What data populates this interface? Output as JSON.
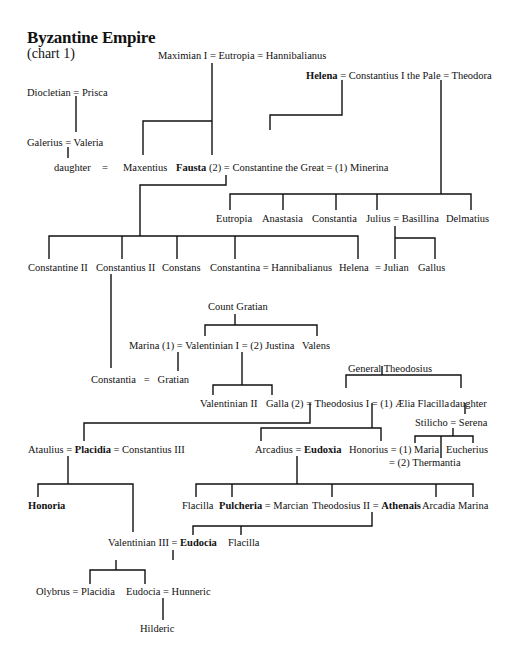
{
  "title": "Byzantine Empire",
  "subtitle": "(chart 1)",
  "nodes": {
    "maximian": "Maximian I = Eutropia = Hannibalianus",
    "diocletian": "Diocletian = Prisca",
    "galerius": "Galerius = Valeria",
    "helena_row": {
      "bold": "Helena",
      "rest": " = Constantius I the Pale = Theodora"
    },
    "daughter": "daughter",
    "eq1": "=",
    "maxentius": "Maxentius",
    "fausta_row": {
      "bold": "Fausta",
      "rest": " (2) = Constantine the Great = (1) Minerina"
    },
    "eutropia": "Eutropia",
    "anastasia": "Anastasia",
    "constantia1": "Constantia",
    "julius": "Julius = Basillina",
    "delmatius": "Delmatius",
    "constantine2": "Constantine II",
    "constantius2": "Constantius II",
    "constans": "Constans",
    "constantina": "Constantina = Hannibalianus",
    "helena2": "Helena",
    "julian": "= Julian",
    "gallus": "Gallus",
    "count_gratian": "Count Gratian",
    "valentinian1": "Marina (1) = Valentinian I = (2) Justina",
    "valens": "Valens",
    "constantia2": "Constantia   =   Gratian",
    "general_theodosius": "General Theodosius",
    "valentinian2": "Valentinian II",
    "theodosius1": "Galla (2) = Theodosius I = (1) Ælia Flacilla",
    "daughter2": "daughter",
    "stilicho": "Stilicho = Serena",
    "placidia_row": {
      "pre": "Ataulius = ",
      "bold": "Placidia",
      "rest": " = Constantius III"
    },
    "arcadius_row": {
      "pre": "Arcadius = ",
      "bold": "Eudoxia"
    },
    "honorius": "Honorius = (1) Maria",
    "thermantia": "= (2) Thermantia",
    "eucherius": "Eucherius",
    "honoria": "Honoria",
    "flacilla1": "Flacilla",
    "pulcheria_row": {
      "bold": "Pulcheria",
      "rest": " = Marcian"
    },
    "theodosius2_row": {
      "pre": "Theodosius II = ",
      "bold": "Athenais"
    },
    "arcadia": "Arcadia",
    "marina": "Marina",
    "valentinian3_row": {
      "pre": "Valentinian III = ",
      "bold": "Eudocia"
    },
    "flacilla2": "Flacilla",
    "olybrus": "Olybrus = Placidia",
    "eudocia": "Eudocia = Hunneric",
    "hilderic": "Hilderic"
  }
}
